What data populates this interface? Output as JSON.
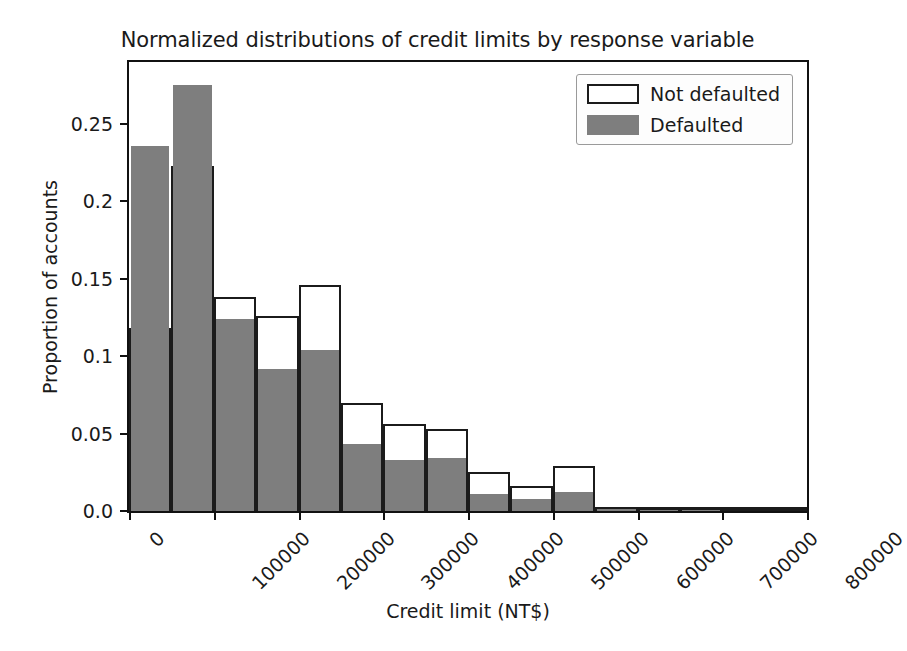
{
  "chart_data": {
    "type": "bar",
    "title": "Normalized distributions of credit limits by response variable",
    "xlabel": "Credit limit (NT$)",
    "ylabel": "Proportion of accounts",
    "xlim": [
      0,
      800000
    ],
    "ylim": [
      0.0,
      0.29
    ],
    "grid": false,
    "legend_position": "upper right",
    "bin_width": 50000,
    "bin_starts": [
      0,
      50000,
      100000,
      150000,
      200000,
      250000,
      300000,
      350000,
      400000,
      450000,
      500000,
      550000,
      600000,
      650000,
      700000,
      750000
    ],
    "xticks": [
      0,
      100000,
      200000,
      300000,
      400000,
      500000,
      600000,
      700000,
      800000
    ],
    "xtick_labels": [
      "0",
      "100000",
      "200000",
      "300000",
      "400000",
      "500000",
      "600000",
      "700000",
      "800000"
    ],
    "yticks": [
      0.0,
      0.05,
      0.1,
      0.15,
      0.2,
      0.25
    ],
    "ytick_labels": [
      "0.0",
      "0.05",
      "0.1",
      "0.15",
      "0.2",
      "0.25"
    ],
    "series": [
      {
        "name": "Not defaulted",
        "style": "unfilled-outline",
        "color": "#ffffff",
        "edge_color": "#1b1b1b",
        "values": [
          0.118,
          0.223,
          0.138,
          0.126,
          0.146,
          0.07,
          0.056,
          0.053,
          0.025,
          0.016,
          0.029,
          0.002,
          0.001,
          0.001,
          0.0005,
          0.0005
        ]
      },
      {
        "name": "Defaulted",
        "style": "filled",
        "color": "#7e7e7e",
        "edge_color": "#7e7e7e",
        "values": [
          0.236,
          0.275,
          0.124,
          0.092,
          0.104,
          0.043,
          0.033,
          0.034,
          0.011,
          0.008,
          0.012,
          0.001,
          0.0005,
          0.0005,
          0.0003,
          0.0003
        ]
      }
    ]
  },
  "legend": {
    "items": [
      {
        "label": "Not defaulted",
        "swatch": "outline"
      },
      {
        "label": "Defaulted",
        "swatch": "filled"
      }
    ]
  },
  "colors": {
    "defaulted_fill": "#7e7e7e",
    "not_defaulted_fill": "#ffffff",
    "edge": "#1b1b1b",
    "axis": "#111111",
    "text": "#1a1a1a",
    "background": "#ffffff"
  }
}
